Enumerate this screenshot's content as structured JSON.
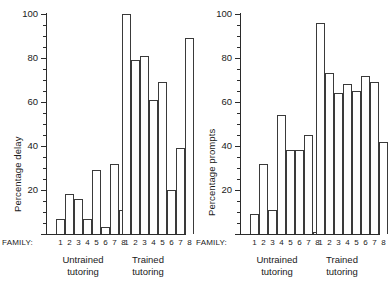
{
  "figure": {
    "background": "#ffffff",
    "line_color": "#3a3a3a"
  },
  "axis": {
    "tick_labels": [
      "100",
      "80",
      "60",
      "40",
      "20"
    ],
    "family_prefix": "FAMILY:",
    "family_numbers": [
      "1",
      "2",
      "3",
      "4",
      "5",
      "6",
      "7",
      "8"
    ],
    "group_untrained_line1": "Untrained",
    "group_untrained_line2": "tutoring",
    "group_trained_line1": "Trained",
    "group_trained_line2": "tutoring"
  },
  "chart_data": [
    {
      "type": "bar",
      "title": "",
      "xlabel": "FAMILY:",
      "ylabel": "Percentage delay",
      "ylim": [
        0,
        100
      ],
      "yticks": [
        0,
        20,
        40,
        60,
        80,
        100
      ],
      "ytick_labels": [
        "",
        "20",
        "40",
        "60",
        "80",
        "100"
      ],
      "minor_tick_step": 5,
      "grid": false,
      "legend": "none",
      "categories": [
        "1",
        "2",
        "3",
        "4",
        "5",
        "6",
        "7",
        "8"
      ],
      "groups": [
        {
          "name": "Untrained tutoring",
          "values": [
            7,
            18,
            16,
            7,
            29,
            3,
            32,
            11
          ]
        },
        {
          "name": "Trained tutoring",
          "values": [
            100,
            79,
            81,
            61,
            69,
            20,
            39,
            89
          ]
        }
      ]
    },
    {
      "type": "bar",
      "title": "",
      "xlabel": "FAMILY:",
      "ylabel": "Percentage prompts",
      "ylim": [
        0,
        100
      ],
      "yticks": [
        0,
        20,
        40,
        60,
        80,
        100
      ],
      "ytick_labels": [
        "",
        "20",
        "40",
        "60",
        "80",
        "100"
      ],
      "minor_tick_step": 5,
      "grid": false,
      "legend": "none",
      "categories": [
        "1",
        "2",
        "3",
        "4",
        "5",
        "6",
        "7",
        "8"
      ],
      "groups": [
        {
          "name": "Untrained tutoring",
          "values": [
            9,
            32,
            11,
            54,
            38,
            38,
            45,
            1
          ]
        },
        {
          "name": "Trained tutoring",
          "values": [
            96,
            73,
            64,
            68,
            65,
            72,
            69,
            42
          ]
        }
      ]
    }
  ]
}
